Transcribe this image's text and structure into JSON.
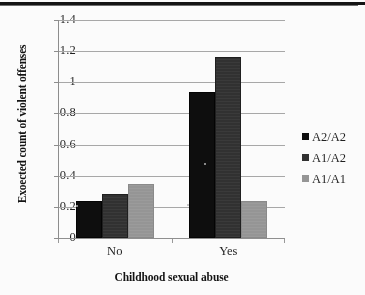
{
  "chart_data": {
    "type": "bar",
    "title": "",
    "xlabel": "Childhood sexual abuse",
    "ylabel": "Exoected count of violent offenses",
    "categories": [
      "No",
      "Yes"
    ],
    "series": [
      {
        "name": "A2/A2",
        "color": "#0a0a0a",
        "values": [
          0.24,
          0.94
        ]
      },
      {
        "name": "A1/A2",
        "color": "#2f2f2f",
        "values": [
          0.28,
          1.16
        ]
      },
      {
        "name": "A1/A1",
        "color": "#969696",
        "values": [
          0.35,
          0.24
        ]
      }
    ],
    "ylim": [
      0,
      1.4
    ],
    "ytick_labels": [
      "0",
      "0.2",
      "0.4",
      "0.6",
      "0.8",
      "1",
      "1.2",
      "1.4"
    ],
    "ytick_values": [
      0,
      0.2,
      0.4,
      0.6,
      0.8,
      1,
      1.2,
      1.4
    ],
    "grid": true,
    "legend_position": "right"
  }
}
